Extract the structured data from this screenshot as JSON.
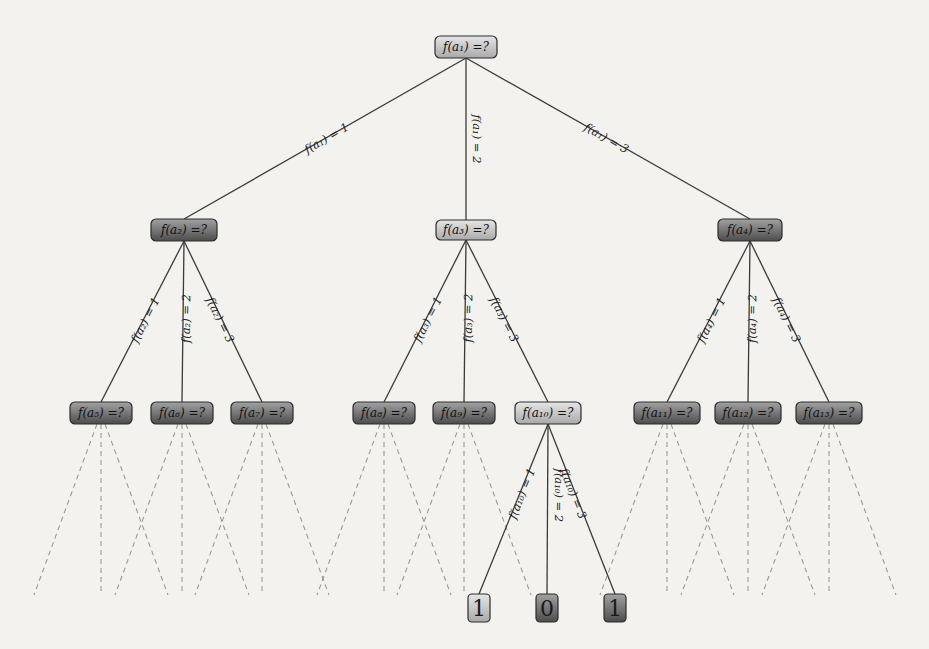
{
  "diagram": {
    "colors": {
      "background": "#f3f2ef",
      "edge": "#3a3a3a",
      "dashed_edge": "#9a9a9a",
      "node_light_top": "#e2e2e2",
      "node_light_bottom": "#a8a8a8",
      "node_dark_top": "#9a9a9a",
      "node_dark_bottom": "#4a4a4a",
      "node_border": "#2c2c2c"
    },
    "nodes": [
      {
        "id": "a1",
        "label": "f(a₁) =?",
        "x": 466,
        "y": 47,
        "w": 62,
        "h": 22,
        "shade": "light"
      },
      {
        "id": "a2",
        "label": "f(a₂) =?",
        "x": 184,
        "y": 230,
        "w": 66,
        "h": 22,
        "shade": "dark"
      },
      {
        "id": "a3",
        "label": "f(a₃) =?",
        "x": 466,
        "y": 230,
        "w": 60,
        "h": 20,
        "shade": "light"
      },
      {
        "id": "a4",
        "label": "f(a₄) =?",
        "x": 750,
        "y": 230,
        "w": 64,
        "h": 22,
        "shade": "dark"
      },
      {
        "id": "a5",
        "label": "f(a₅) =?",
        "x": 101,
        "y": 413,
        "w": 62,
        "h": 22,
        "shade": "dark"
      },
      {
        "id": "a6",
        "label": "f(a₆) =?",
        "x": 182,
        "y": 413,
        "w": 62,
        "h": 22,
        "shade": "dark"
      },
      {
        "id": "a7",
        "label": "f(a₇) =?",
        "x": 262,
        "y": 413,
        "w": 62,
        "h": 22,
        "shade": "dark"
      },
      {
        "id": "a8",
        "label": "f(a₈) =?",
        "x": 384,
        "y": 413,
        "w": 62,
        "h": 22,
        "shade": "dark"
      },
      {
        "id": "a9",
        "label": "f(a₉) =?",
        "x": 464,
        "y": 413,
        "w": 62,
        "h": 22,
        "shade": "dark"
      },
      {
        "id": "a10",
        "label": "f(a₁₀) =?",
        "x": 548,
        "y": 413,
        "w": 66,
        "h": 22,
        "shade": "light"
      },
      {
        "id": "a11",
        "label": "f(a₁₁) =?",
        "x": 667,
        "y": 413,
        "w": 66,
        "h": 22,
        "shade": "dark"
      },
      {
        "id": "a12",
        "label": "f(a₁₂) =?",
        "x": 748,
        "y": 413,
        "w": 66,
        "h": 22,
        "shade": "dark"
      },
      {
        "id": "a13",
        "label": "f(a₁₃) =?",
        "x": 829,
        "y": 413,
        "w": 66,
        "h": 22,
        "shade": "dark"
      }
    ],
    "leaves": [
      {
        "id": "leaf1",
        "label": "1",
        "x": 479,
        "y": 608,
        "w": 22,
        "h": 28,
        "shade": "light"
      },
      {
        "id": "leaf2",
        "label": "0",
        "x": 547,
        "y": 608,
        "w": 22,
        "h": 28,
        "shade": "dark"
      },
      {
        "id": "leaf3",
        "label": "1",
        "x": 615,
        "y": 608,
        "w": 22,
        "h": 28,
        "shade": "dark"
      }
    ],
    "edges": [
      {
        "from": "a1",
        "to": "a2",
        "label": "f(a₁) = 1"
      },
      {
        "from": "a1",
        "to": "a3",
        "label": "f(a₁) = 2"
      },
      {
        "from": "a1",
        "to": "a4",
        "label": "f(a₁) = 3"
      },
      {
        "from": "a2",
        "to": "a5",
        "label": "f(a₂) = 1"
      },
      {
        "from": "a2",
        "to": "a6",
        "label": "f(a₂) = 2"
      },
      {
        "from": "a2",
        "to": "a7",
        "label": "f(a₂) = 3"
      },
      {
        "from": "a3",
        "to": "a8",
        "label": "f(a₃) = 1"
      },
      {
        "from": "a3",
        "to": "a9",
        "label": "f(a₃) = 2"
      },
      {
        "from": "a3",
        "to": "a10",
        "label": "f(a₃) = 3"
      },
      {
        "from": "a4",
        "to": "a11",
        "label": "f(a₄) = 1"
      },
      {
        "from": "a4",
        "to": "a12",
        "label": "f(a₄) = 2"
      },
      {
        "from": "a4",
        "to": "a13",
        "label": "f(a₄) = 3"
      },
      {
        "from": "a10",
        "to": "leaf1",
        "label": "f(a₁₀) = 1"
      },
      {
        "from": "a10",
        "to": "leaf2",
        "label": "f(a₁₀) = 2"
      },
      {
        "from": "a10",
        "to": "leaf3",
        "label": "f(a₁₀) = 3"
      }
    ],
    "truncated_nodes": [
      "a5",
      "a6",
      "a7",
      "a8",
      "a9",
      "a11",
      "a12",
      "a13"
    ],
    "truncated_spread": 67,
    "truncated_bottom_y": 595
  }
}
